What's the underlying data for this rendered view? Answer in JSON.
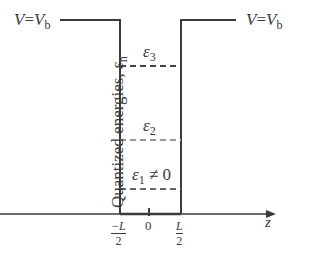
{
  "diagram": {
    "type": "finite quantum well energy diagram",
    "barrier_label_left": {
      "lhs": "V",
      "eq": "=",
      "rhs": "V",
      "sub": "b"
    },
    "barrier_label_right": {
      "lhs": "V",
      "eq": "=",
      "rhs": "V",
      "sub": "b"
    },
    "y_axis_label": {
      "text": "Quantized energies, ",
      "symbol": "ε",
      "sub": "n"
    },
    "x_axis_label": "z",
    "levels": [
      {
        "symbol": "ε",
        "sub": "3",
        "suffix": ""
      },
      {
        "symbol": "ε",
        "sub": "2",
        "suffix": ""
      },
      {
        "symbol": "ε",
        "sub": "1",
        "suffix": " ≠ 0"
      }
    ],
    "ticks": [
      {
        "num": "−L",
        "den": "2"
      },
      {
        "label": "0"
      },
      {
        "num": "L",
        "den": "2"
      }
    ],
    "colors": {
      "wall": "#3a3a3a",
      "level_dark": "#444444",
      "level_light": "#999999"
    }
  }
}
